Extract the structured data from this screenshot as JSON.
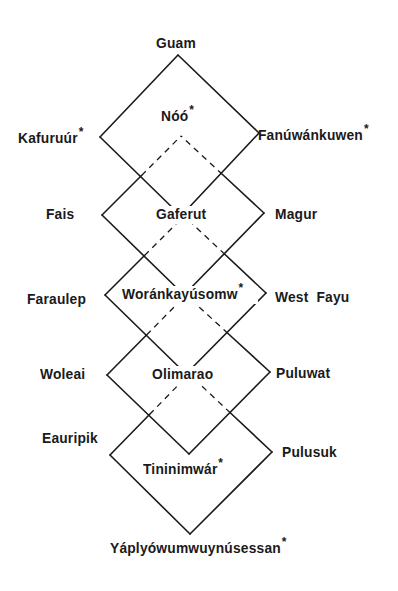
{
  "diagram": {
    "line_color": "#1a1a1a",
    "top_label": {
      "text": "Guam",
      "marked": false
    },
    "bottom_label": {
      "text": "Yáplyówumwuynúsessan",
      "marked": true
    },
    "marker": "*",
    "levels": [
      {
        "left": {
          "text": "Kafuruúr",
          "marked": true
        },
        "center": {
          "text": "Nóó",
          "marked": true
        },
        "right": {
          "text": "Fanúwánkuwen",
          "marked": true
        }
      },
      {
        "left": {
          "text": "Fais",
          "marked": false
        },
        "center": {
          "text": "Gaferut",
          "marked": false
        },
        "right": {
          "text": "Magur",
          "marked": false
        }
      },
      {
        "left": {
          "text": "Faraulep",
          "marked": false
        },
        "center": {
          "text": "Woránkayúsomw",
          "marked": true
        },
        "right": {
          "text": "West  Fayu",
          "marked": false
        }
      },
      {
        "left": {
          "text": "Woleai",
          "marked": false
        },
        "center": {
          "text": "Olimarao",
          "marked": false
        },
        "right": {
          "text": "Puluwat",
          "marked": false
        }
      },
      {
        "left": {
          "text": "Eauripik",
          "marked": false
        },
        "center": {
          "text": "Tininimwár",
          "marked": true
        },
        "right": {
          "text": "Pulusuk",
          "marked": false
        }
      }
    ],
    "diamonds": [
      {
        "top": [
          178,
          55
        ],
        "left": [
          100,
          137
        ],
        "right": [
          259,
          133
        ],
        "bottom": [
          181,
          216
        ]
      },
      {
        "top": [
          181,
          136
        ],
        "left": [
          102,
          215
        ],
        "right": [
          264,
          213
        ],
        "bottom": [
          184,
          295
        ]
      },
      {
        "top": [
          184,
          216
        ],
        "left": [
          105,
          295
        ],
        "right": [
          266,
          293
        ],
        "bottom": [
          186,
          374
        ]
      },
      {
        "top": [
          186,
          295
        ],
        "left": [
          107,
          375
        ],
        "right": [
          270,
          372
        ],
        "bottom": [
          189,
          454
        ]
      },
      {
        "top": [
          189,
          374
        ],
        "left": [
          110,
          455
        ],
        "right": [
          272,
          452
        ],
        "bottom": [
          190,
          534
        ]
      }
    ]
  }
}
